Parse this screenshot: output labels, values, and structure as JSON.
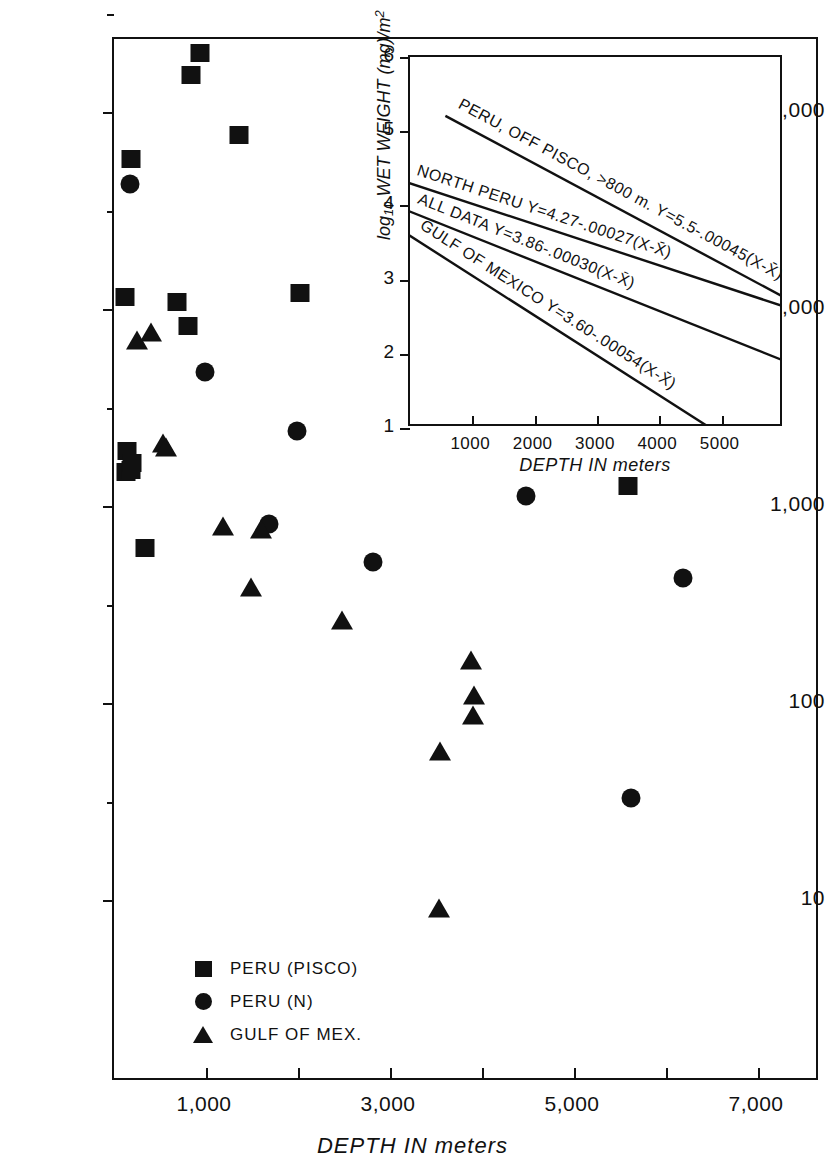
{
  "figure": {
    "background": "#ffffff",
    "ink_color": "#111111"
  },
  "main_axes": {
    "xlabel": "DEPTH IN meters",
    "ylabel": "milligrams WET WEIGHT PER square meter",
    "xticklabels": [
      "1,000",
      "3,000",
      "5,000",
      "7,000"
    ],
    "xticklabel_values": [
      1000,
      3000,
      5000,
      7000
    ],
    "yticklabels": [
      "100,000",
      "10,000",
      "1,000",
      "100",
      "10"
    ],
    "yticklabel_values": [
      100000,
      10000,
      1000,
      100,
      10
    ]
  },
  "legend": {
    "items": [
      {
        "marker": "square-marker",
        "label": "PERU (PISCO)"
      },
      {
        "marker": "circle-marker",
        "label": "PERU (N)"
      },
      {
        "marker": "triangle-marker",
        "label": "GULF OF MEX."
      }
    ]
  },
  "inset_labels": {
    "xlabel": "DEPTH IN meters",
    "ylabel_prefix": "log",
    "ylabel_sub": "10",
    "ylabel_rest": " WET WEIGHT (mg)/m",
    "ylabel_sup": "2",
    "xticklabels": [
      "1000",
      "2000",
      "3000",
      "4000",
      "5000"
    ],
    "yticklabels": [
      "6",
      "5",
      "4",
      "3",
      "2",
      "1"
    ],
    "regression_labels": [
      "PERU, OFF PISCO, >800 m.  Y=5.5-.00045(X-X̄)",
      "NORTH PERU   Y=4.27-.00027(X-X̄)",
      "ALL DATA    Y=3.86-.00030(X-X̄)",
      "GULF OF MEXICO   Y=3.60-.00054(X-X̄)"
    ]
  },
  "chart_data": {
    "type": "scatter",
    "title": "",
    "xlabel": "DEPTH IN meters",
    "ylabel": "milligrams WET WEIGHT PER square meter",
    "xlim": [
      0,
      7670
    ],
    "ylim": [
      5.5,
      300000
    ],
    "yscale": "log",
    "xscale": "linear",
    "grid": false,
    "legend_position": "lower-left",
    "series": [
      {
        "name": "PERU (PISCO)",
        "marker": "square",
        "points": [
          {
            "x": 930,
            "y": 200000
          },
          {
            "x": 840,
            "y": 155000
          },
          {
            "x": 180,
            "y": 58000
          },
          {
            "x": 1360,
            "y": 76000
          },
          {
            "x": 120,
            "y": 11500
          },
          {
            "x": 690,
            "y": 10800
          },
          {
            "x": 800,
            "y": 8200
          },
          {
            "x": 2020,
            "y": 12000
          },
          {
            "x": 140,
            "y": 1900
          },
          {
            "x": 130,
            "y": 1480
          },
          {
            "x": 190,
            "y": 1530
          },
          {
            "x": 200,
            "y": 1650
          },
          {
            "x": 340,
            "y": 610
          },
          {
            "x": 5590,
            "y": 1260
          }
        ]
      },
      {
        "name": "PERU (N)",
        "marker": "circle",
        "points": [
          {
            "x": 175,
            "y": 43000
          },
          {
            "x": 990,
            "y": 4800
          },
          {
            "x": 1990,
            "y": 2400
          },
          {
            "x": 1680,
            "y": 810
          },
          {
            "x": 2820,
            "y": 520
          },
          {
            "x": 4480,
            "y": 1130
          },
          {
            "x": 6180,
            "y": 430
          },
          {
            "x": 5620,
            "y": 33
          }
        ]
      },
      {
        "name": "GULF OF MEX.",
        "marker": "triangle",
        "points": [
          {
            "x": 250,
            "y": 7000
          },
          {
            "x": 400,
            "y": 7600
          },
          {
            "x": 530,
            "y": 2100
          },
          {
            "x": 560,
            "y": 2000
          },
          {
            "x": 1180,
            "y": 790
          },
          {
            "x": 1600,
            "y": 760
          },
          {
            "x": 1490,
            "y": 390
          },
          {
            "x": 2480,
            "y": 265
          },
          {
            "x": 3880,
            "y": 165
          },
          {
            "x": 3910,
            "y": 110
          },
          {
            "x": 3900,
            "y": 87
          },
          {
            "x": 3540,
            "y": 57
          },
          {
            "x": 3530,
            "y": 9.1
          }
        ]
      }
    ],
    "inset": {
      "type": "line",
      "xlabel": "DEPTH IN meters",
      "ylabel": "log10 WET WEIGHT (mg)/m2",
      "xlim": [
        0,
        6000
      ],
      "ylim": [
        1,
        6
      ],
      "grid": false,
      "series": [
        {
          "name": "PERU, OFF PISCO, >800 m.",
          "equation": "Y=5.5-.00045(X-X̄)",
          "intercept_at_x0": 5.52,
          "slope_per_m": -0.00045,
          "x_start": 600,
          "x_end": 6000,
          "y_start": 5.18,
          "y_end": 2.75
        },
        {
          "name": "NORTH PERU",
          "equation": "Y=4.27-.00027(X-X̄)",
          "intercept_at_x0": 4.28,
          "slope_per_m": -0.00027,
          "x_start": 0,
          "x_end": 6000,
          "y_start": 4.28,
          "y_end": 2.62
        },
        {
          "name": "ALL DATA",
          "equation": "Y=3.86-.00030(X-X̄)",
          "intercept_at_x0": 3.9,
          "slope_per_m": -0.0003,
          "x_start": 0,
          "x_end": 6000,
          "y_start": 3.9,
          "y_end": 1.89
        },
        {
          "name": "GULF OF MEXICO",
          "equation": "Y=3.60-.00054(X-X̄)",
          "intercept_at_x0": 3.58,
          "slope_per_m": -0.00054,
          "x_start": 0,
          "x_end": 4800,
          "y_start": 3.58,
          "y_end": 1.0
        }
      ]
    }
  }
}
